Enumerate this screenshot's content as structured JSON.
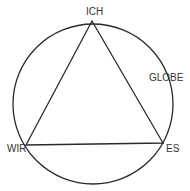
{
  "diagram": {
    "labels": {
      "top": "ICH",
      "left": "WIR",
      "right": "ES",
      "circle": "GLOBE"
    },
    "colors": {
      "stroke": "#2a2a2a",
      "text": "#333333",
      "background": "#ffffff"
    }
  }
}
